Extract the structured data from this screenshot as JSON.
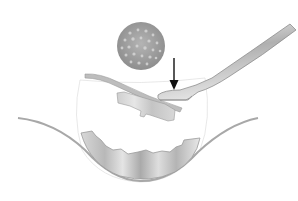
{
  "figure": {
    "type": "medical-illustration",
    "elements": {
      "magnified_inset": {
        "shape": "circle",
        "texture": "granular dots",
        "color": "#9a9a9a"
      },
      "arrow": {
        "direction": "down",
        "color": "#111111"
      },
      "instrument": {
        "type": "spatula/forceps",
        "color": "#b8b8b8"
      },
      "tissue_graft": {
        "color": "#bdbdbd"
      },
      "flap": {
        "color": "#a8a8a8"
      },
      "lower_shaded_region": {
        "color": "#bfbfbf"
      },
      "outer_curve": {
        "color": "#a0a0a0"
      }
    },
    "labels": []
  },
  "colors": {
    "background": "#ffffff",
    "line": "#9c9c9c",
    "shade_light": "#dcdcdc",
    "shade_dark": "#9a9a9a",
    "arrow": "#111111"
  }
}
